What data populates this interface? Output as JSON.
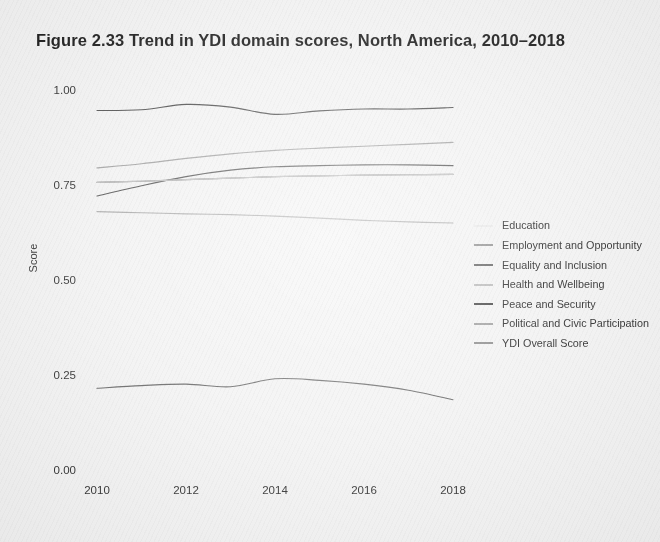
{
  "figure": {
    "title": "Figure 2.33   Trend in YDI domain scores, North America, 2010–2018"
  },
  "axes": {
    "ylabel": "Score",
    "yticks": [
      "0.00",
      "0.25",
      "0.50",
      "0.75",
      "1.00"
    ],
    "xticks": [
      "2010",
      "2012",
      "2014",
      "2016",
      "2018"
    ]
  },
  "legend": {
    "title": "",
    "items": [
      {
        "label": "Education",
        "color": "#e8e8e8"
      },
      {
        "label": "Employment and Opportunity",
        "color": "#8c8c8c"
      },
      {
        "label": "Equality and Inclusion",
        "color": "#5a5a5a"
      },
      {
        "label": "Health and Wellbeing",
        "color": "#b5b5b5"
      },
      {
        "label": "Peace and Security",
        "color": "#3a3a3a"
      },
      {
        "label": "Political and Civic Participation",
        "color": "#9a9a9a"
      },
      {
        "label": "YDI Overall Score",
        "color": "#878787"
      }
    ]
  },
  "chart_data": {
    "type": "line",
    "title": "Figure 2.33   Trend in YDI domain scores, North America, 2010–2018",
    "xlabel": "",
    "ylabel": "Score",
    "xlim": [
      2010,
      2018
    ],
    "ylim": [
      0.0,
      1.0
    ],
    "grid": false,
    "legend_position": "right",
    "x": [
      2010,
      2011,
      2012,
      2013,
      2014,
      2015,
      2016,
      2017,
      2018
    ],
    "series": [
      {
        "name": "Health and Wellbeing",
        "color": "#4a4a4a",
        "values": [
          0.946,
          0.948,
          0.962,
          0.955,
          0.936,
          0.945,
          0.95,
          0.95,
          0.954
        ]
      },
      {
        "name": "Education",
        "color": "#9e9e9e",
        "values": [
          0.795,
          0.806,
          0.82,
          0.832,
          0.841,
          0.847,
          0.852,
          0.857,
          0.862
        ]
      },
      {
        "name": "Equality and Inclusion",
        "color": "#4f4f4f",
        "values": [
          0.721,
          0.748,
          0.772,
          0.789,
          0.798,
          0.801,
          0.803,
          0.803,
          0.801
        ]
      },
      {
        "name": "YDI Overall Score",
        "color": "#787878",
        "values": [
          0.757,
          0.76,
          0.764,
          0.768,
          0.772,
          0.774,
          0.776,
          0.777,
          0.778
        ]
      },
      {
        "name": "Employment and Opportunity",
        "color": "#a8a8a8",
        "values": [
          0.68,
          0.677,
          0.674,
          0.672,
          0.668,
          0.663,
          0.657,
          0.653,
          0.65
        ]
      },
      {
        "name": "Peace and Security",
        "color": "#bdbdbd",
        "values": [
          0.757,
          0.76,
          0.764,
          0.768,
          0.772,
          0.774,
          0.776,
          0.777,
          0.778
        ]
      },
      {
        "name": "Political and Civic Participation",
        "color": "#606060",
        "values": [
          0.215,
          0.222,
          0.226,
          0.219,
          0.24,
          0.236,
          0.226,
          0.21,
          0.185
        ]
      }
    ]
  }
}
